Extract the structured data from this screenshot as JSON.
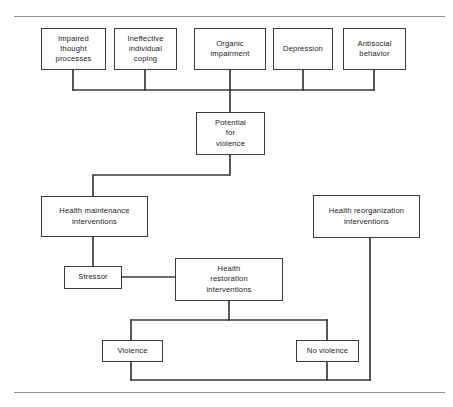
{
  "figure": {
    "type": "flowchart",
    "orientation": "top-down",
    "line_color": "#3a3a3a",
    "rule_color": "#8e8e8e",
    "background": "#ffffff"
  },
  "rules": [
    {
      "name": "top-rule",
      "x": 14,
      "y": 16,
      "width": 431
    },
    {
      "name": "bottom-rule",
      "x": 14,
      "y": 392,
      "width": 431
    }
  ],
  "nodes": [
    {
      "id": "impaired-thought-processes",
      "label": "Impaired\nthought\nprocesses",
      "x": 41,
      "y": 28,
      "w": 65,
      "h": 42
    },
    {
      "id": "ineffective-individual-coping",
      "label": "Ineffective\nindividual\ncoping",
      "x": 114,
      "y": 28,
      "w": 63,
      "h": 42
    },
    {
      "id": "organic-impairment",
      "label": "Organic\nimpairment",
      "x": 194,
      "y": 28,
      "w": 72,
      "h": 42
    },
    {
      "id": "depression",
      "label": "Depression",
      "x": 273,
      "y": 28,
      "w": 60,
      "h": 42
    },
    {
      "id": "antisocial-behavior",
      "label": "Antisocial\nbehavior",
      "x": 343,
      "y": 28,
      "w": 63,
      "h": 42
    },
    {
      "id": "potential-for-violence",
      "label": "Potential\nfor\nviolence",
      "x": 196,
      "y": 112,
      "w": 69,
      "h": 43
    },
    {
      "id": "health-maintenance-interventions",
      "label": "Health maintenance\ninterventions",
      "x": 41,
      "y": 196,
      "w": 107,
      "h": 41
    },
    {
      "id": "health-reorganization-interventions",
      "label": "Health reorganization\ninterventions",
      "x": 313,
      "y": 195,
      "w": 107,
      "h": 43
    },
    {
      "id": "stressor",
      "label": "Stressor",
      "x": 64,
      "y": 266,
      "w": 58,
      "h": 23
    },
    {
      "id": "health-restoration-interventions",
      "label": "Health\nrestoration\ninterventions",
      "x": 175,
      "y": 258,
      "w": 108,
      "h": 43
    },
    {
      "id": "violence",
      "label": "Violence",
      "x": 102,
      "y": 340,
      "w": 61,
      "h": 22
    },
    {
      "id": "no-violence",
      "label": "No violence",
      "x": 296,
      "y": 340,
      "w": 63,
      "h": 22
    }
  ],
  "connectors": [
    {
      "id": "impaired-to-bus",
      "path": "M73,70 L73,90"
    },
    {
      "id": "ineffective-to-bus",
      "path": "M145,70 L145,90"
    },
    {
      "id": "organic-to-bus",
      "path": "M230,70 L230,90"
    },
    {
      "id": "depression-to-bus",
      "path": "M303,70 L303,90"
    },
    {
      "id": "antisocial-to-bus",
      "path": "M374,70 L374,90"
    },
    {
      "id": "top-bus",
      "path": "M73,90 L374,90"
    },
    {
      "id": "bus-to-potential",
      "path": "M230,90 L230,112"
    },
    {
      "id": "potential-to-maintenance",
      "path": "M230,155 L230,175 L93,175 L93,196"
    },
    {
      "id": "maintenance-to-stressor",
      "path": "M93,237 L93,266"
    },
    {
      "id": "stressor-to-restoration",
      "path": "M122,277 L175,277"
    },
    {
      "id": "restoration-to-branch",
      "path": "M229,301 L229,320"
    },
    {
      "id": "branch-bus",
      "path": "M131,320 L327,320"
    },
    {
      "id": "branch-to-violence",
      "path": "M131,320 L131,340"
    },
    {
      "id": "branch-to-no-violence",
      "path": "M327,320 L327,340"
    },
    {
      "id": "violence-to-return",
      "path": "M131,362 L131,380"
    },
    {
      "id": "no-violence-to-return",
      "path": "M327,362 L327,380"
    },
    {
      "id": "return-bus",
      "path": "M131,380 L370,380"
    },
    {
      "id": "reorganization-down",
      "path": "M370,238 L370,380"
    }
  ]
}
